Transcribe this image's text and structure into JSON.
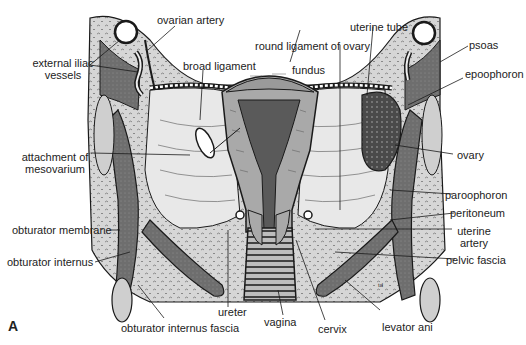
{
  "figure": {
    "panel_letter": "A",
    "style": "grayscale anatomical line drawing",
    "colors": {
      "background": "#ffffff",
      "connective_tissue": "#d4d4d4",
      "muscle_dark": "#7a7a7a",
      "uterus": "#a8a8a8",
      "uterine_cavity": "#5a5a5a",
      "broad_ligament": "#e6e6e6",
      "outline": "#1a1a1a"
    }
  },
  "labels": {
    "ovarian_artery": "ovarian artery",
    "external_iliac_vessels_line1": "external iliac",
    "external_iliac_vessels_line2": "vessels",
    "broad_ligament": "broad ligament",
    "attachment_line1": "attachment of",
    "attachment_line2": "mesovarium",
    "obturator_membrane": "obturator membrane",
    "obturator_internus": "obturator internus",
    "obturator_internus_fascia": "obturator internus fascia",
    "ureter": "ureter",
    "vagina": "vagina",
    "cervix": "cervix",
    "levator_ani": "levator ani",
    "round_ligament_of_ovary": "round ligament of ovary",
    "fundus": "fundus",
    "uterine_tube": "uterine tube",
    "psoas": "psoas",
    "epoophoron": "epoophoron",
    "ovary": "ovary",
    "paroophoron": "paroophoron",
    "peritoneum": "peritoneum",
    "uterine_artery_line1": "uterine",
    "uterine_artery_line2": "artery",
    "pelvic_fascia": "pelvic fascia"
  }
}
